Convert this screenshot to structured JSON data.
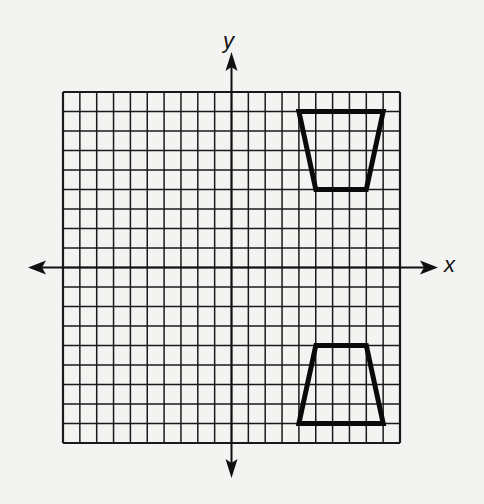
{
  "diagram": {
    "type": "coordinate-grid",
    "axes": {
      "x_label": "x",
      "y_label": "y",
      "x_range": [
        -10,
        10
      ],
      "y_range": [
        -9,
        9
      ],
      "grid_columns": 20,
      "grid_rows": 18,
      "arrows": true,
      "tick_labels": false
    },
    "shapes": [
      {
        "name": "trapezoid-original",
        "type": "trapezoid",
        "vertices": [
          [
            4,
            8
          ],
          [
            9,
            8
          ],
          [
            8,
            4
          ],
          [
            5,
            4
          ]
        ],
        "quadrant": "I"
      },
      {
        "name": "trapezoid-image",
        "type": "trapezoid",
        "vertices": [
          [
            5,
            -4
          ],
          [
            8,
            -4
          ],
          [
            9,
            -8
          ],
          [
            4,
            -8
          ]
        ],
        "quadrant": "IV"
      }
    ],
    "colors": {
      "background": "#f3f3f1",
      "grid_lines": "#1a1a1a",
      "shape_stroke": "#0a0a0a"
    }
  }
}
